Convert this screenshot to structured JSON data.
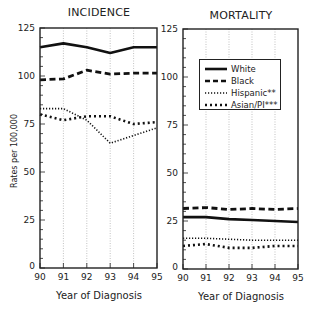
{
  "chart_data": [
    {
      "type": "line",
      "title": "INCIDENCE",
      "xlabel": "Year of Diagnosis",
      "ylabel": "Rates per 100,000",
      "x": [
        "90",
        "91",
        "92",
        "93",
        "94",
        "95"
      ],
      "ylim": [
        0,
        125
      ],
      "yticks": [
        0,
        25,
        50,
        75,
        100,
        125
      ],
      "grid": "vertical dotted",
      "series": [
        {
          "name": "White",
          "style": "solid",
          "values": [
            115,
            117,
            115,
            112,
            115,
            115
          ]
        },
        {
          "name": "Black",
          "style": "dashed",
          "values": [
            98,
            98.5,
            103,
            101,
            101.5,
            101.5
          ]
        },
        {
          "name": "Hispanic**",
          "style": "dotted-fine",
          "values": [
            83,
            83,
            77,
            65,
            69,
            73
          ]
        },
        {
          "name": "Asian/PI***",
          "style": "dotted-heavy",
          "values": [
            80,
            77,
            79,
            79,
            75,
            76
          ]
        }
      ]
    },
    {
      "type": "line",
      "title": "MORTALITY",
      "xlabel": "Year of Diagnosis",
      "ylabel": "",
      "x": [
        "90",
        "91",
        "92",
        "93",
        "94",
        "95"
      ],
      "ylim": [
        0,
        125
      ],
      "yticks": [
        0,
        25,
        50,
        75,
        100,
        125
      ],
      "grid": "vertical dotted",
      "legend_position": "upper center inside",
      "series": [
        {
          "name": "White",
          "style": "solid",
          "values": [
            27,
            27,
            26,
            25.5,
            25,
            24.5
          ]
        },
        {
          "name": "Black",
          "style": "dashed",
          "values": [
            31.5,
            32,
            31,
            31.5,
            31,
            31.5
          ]
        },
        {
          "name": "Hispanic**",
          "style": "dotted-fine",
          "values": [
            16,
            16,
            15.5,
            15,
            15,
            15
          ]
        },
        {
          "name": "Asian/PI***",
          "style": "dotted-heavy",
          "values": [
            12,
            13,
            11,
            11,
            12,
            12
          ]
        }
      ]
    }
  ],
  "panels": {
    "left": {
      "title": "INCIDENCE",
      "xlabel": "Year of Diagnosis",
      "ylabel": "Rates per 100,000"
    },
    "right": {
      "title": "MORTALITY",
      "xlabel": "Year of Diagnosis"
    }
  },
  "legend": {
    "items": [
      "White",
      "Black",
      "Hispanic**",
      "Asian/PI***"
    ]
  }
}
